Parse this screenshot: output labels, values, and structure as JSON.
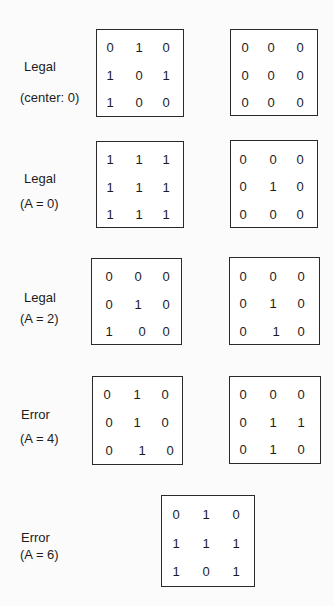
{
  "rows": [
    {
      "status": "Legal",
      "condition": "(center:  0)",
      "grids": [
        {
          "cells": [
            [
              "0",
              "1",
              "0"
            ],
            [
              "1",
              "0",
              "1"
            ],
            [
              "1",
              "0",
              "0"
            ]
          ]
        },
        {
          "cells": [
            [
              "0",
              "0",
              "0"
            ],
            [
              "0",
              "0",
              "0"
            ],
            [
              "0",
              "0",
              "0"
            ]
          ]
        }
      ]
    },
    {
      "status": "Legal",
      "condition": "(A = 0)",
      "grids": [
        {
          "cells": [
            [
              "1",
              "1",
              "1"
            ],
            [
              "1",
              "1",
              "1"
            ],
            [
              "1",
              "1",
              "1"
            ]
          ]
        },
        {
          "cells": [
            [
              "0",
              "0",
              "0"
            ],
            [
              "0",
              "1",
              "0"
            ],
            [
              "0",
              "0",
              "0"
            ]
          ]
        }
      ]
    },
    {
      "status": "Legal",
      "condition": "(A = 2)",
      "grids": [
        {
          "cells": [
            [
              "0",
              "0",
              "0"
            ],
            [
              "0",
              "1",
              "0"
            ],
            [
              "1",
              "0",
              "0"
            ]
          ]
        },
        {
          "cells": [
            [
              "0",
              "0",
              "0"
            ],
            [
              "0",
              "1",
              "0"
            ],
            [
              "0",
              "1",
              "0"
            ]
          ]
        }
      ]
    },
    {
      "status": "Error",
      "condition": "(A = 4)",
      "grids": [
        {
          "cells": [
            [
              "0",
              "1",
              "0"
            ],
            [
              "0",
              "1",
              "0"
            ],
            [
              "0",
              "1",
              "0"
            ]
          ]
        },
        {
          "cells": [
            [
              "0",
              "0",
              "0"
            ],
            [
              "0",
              "1",
              "1"
            ],
            [
              "0",
              "1",
              "0"
            ]
          ]
        }
      ]
    },
    {
      "status": "Error",
      "condition": "(A = 6)",
      "grids": [
        {
          "cells": [
            [
              "0",
              "1",
              "0"
            ],
            [
              "1",
              "1",
              "1"
            ],
            [
              "1",
              "0",
              "1"
            ]
          ]
        }
      ]
    }
  ]
}
